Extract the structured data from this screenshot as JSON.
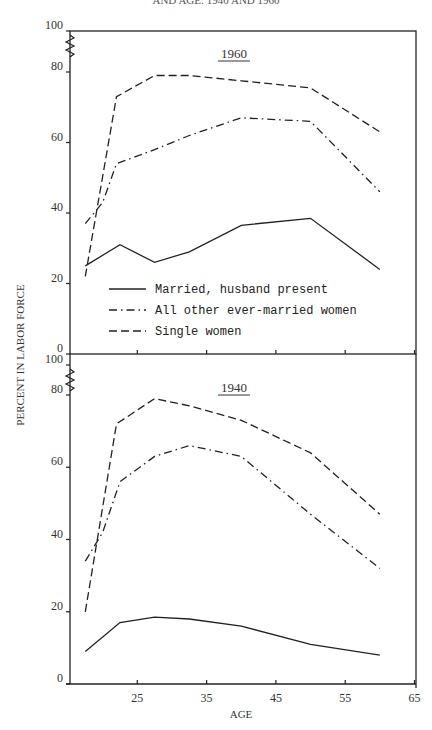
{
  "caption_partial": "AND AGE: 1940 AND 1960",
  "chart_data": [
    {
      "type": "line",
      "title": "1960",
      "xlabel": "AGE",
      "ylabel": "PERCENT IN LABOR FORCE",
      "xlim": [
        15,
        65
      ],
      "ylim": [
        0,
        100
      ],
      "y_axis_break": "between 80 and 100",
      "yticks": [
        0,
        20,
        40,
        60,
        80,
        100
      ],
      "xticks": [
        25,
        35,
        45,
        55,
        65
      ],
      "grid": false,
      "legend_position": "lower-center inside panel",
      "series": [
        {
          "name": "Married, husband present",
          "style": "solid",
          "x": [
            17.5,
            22.5,
            27.5,
            32.5,
            40,
            50,
            60
          ],
          "y": [
            25,
            31,
            26,
            29,
            36.5,
            38.5,
            24
          ]
        },
        {
          "name": "All other ever-married women",
          "style": "dash-dot",
          "x": [
            17.5,
            20,
            22,
            27.5,
            32.5,
            40,
            45,
            50,
            60
          ],
          "y": [
            37,
            43,
            54,
            58,
            62,
            67,
            66.5,
            66,
            46
          ]
        },
        {
          "name": "Single women",
          "style": "dashed",
          "x": [
            17.5,
            22,
            27.5,
            32.5,
            40,
            50,
            60
          ],
          "y": [
            22,
            73,
            79,
            79,
            77.5,
            75.5,
            63
          ]
        }
      ]
    },
    {
      "type": "line",
      "title": "1940",
      "xlabel": "AGE",
      "ylabel": "PERCENT IN LABOR FORCE",
      "xlim": [
        15,
        65
      ],
      "ylim": [
        0,
        100
      ],
      "y_axis_break": "between 80 and 100",
      "yticks": [
        0,
        20,
        40,
        60,
        80,
        100
      ],
      "xticks": [
        25,
        35,
        45,
        55,
        65
      ],
      "grid": false,
      "series": [
        {
          "name": "Married, husband present",
          "style": "solid",
          "x": [
            17.5,
            22.5,
            27.5,
            32.5,
            40,
            50,
            60
          ],
          "y": [
            9,
            17,
            18.5,
            18,
            16,
            11,
            8
          ]
        },
        {
          "name": "All other ever-married women",
          "style": "dash-dot",
          "x": [
            17.5,
            20,
            22.5,
            27.5,
            32.5,
            40,
            50,
            60
          ],
          "y": [
            34,
            42,
            56,
            63,
            66,
            63,
            47,
            32
          ]
        },
        {
          "name": "Single women",
          "style": "dashed",
          "x": [
            17.5,
            22,
            27.5,
            32.5,
            40,
            50,
            60
          ],
          "y": [
            20,
            72,
            79,
            77,
            73,
            64,
            47
          ]
        }
      ]
    }
  ],
  "legend": {
    "items": [
      {
        "label": "Married, husband present",
        "style": "solid"
      },
      {
        "label": "All other ever-married women",
        "style": "dash-dot"
      },
      {
        "label": "Single women",
        "style": "dashed"
      }
    ]
  },
  "panels": {
    "top_title": "1960",
    "bottom_title": "1940"
  },
  "axes": {
    "ylabel": "PERCENT IN LABOR FORCE",
    "xlabel": "AGE",
    "ytick_labels": [
      "100",
      "80",
      "60",
      "40",
      "20",
      "0"
    ],
    "xtick_labels": [
      "25",
      "35",
      "45",
      "55",
      "65"
    ]
  }
}
